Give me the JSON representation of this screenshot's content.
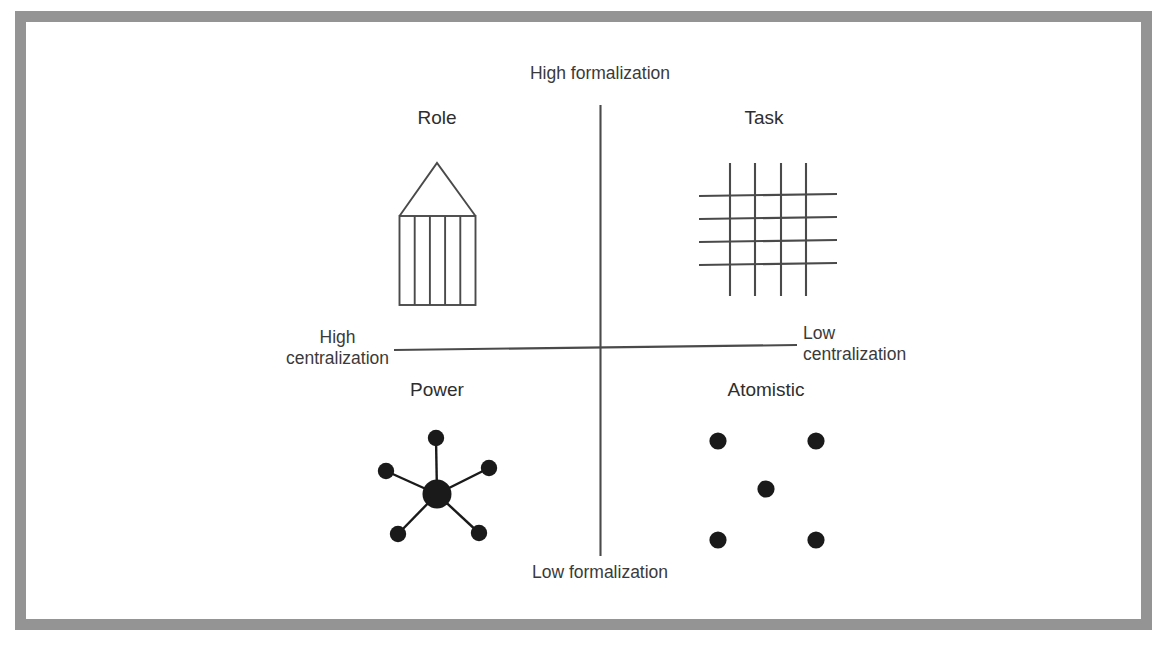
{
  "diagram": {
    "type": "2x2-matrix",
    "axes": {
      "vertical": {
        "top_label": "High formalization",
        "bottom_label": "Low formalization"
      },
      "horizontal": {
        "left_label_line1": "High",
        "left_label_line2": "centralization",
        "right_label_line1": "Low",
        "right_label_line2": "centralization"
      }
    },
    "quadrants": [
      {
        "id": "role",
        "label": "Role",
        "position": "top-left",
        "icon": "greek-temple-icon",
        "icon_description": "Greek temple: triangular pediment over a rectangle divided into 5 columns by 4 vertical lines",
        "columns": 5
      },
      {
        "id": "task",
        "label": "Task",
        "position": "top-right",
        "icon": "lattice-grid-icon",
        "icon_description": "Crossing mesh of 4 vertical and 4 horizontal lines forming a net",
        "vertical_lines": 4,
        "horizontal_lines": 4
      },
      {
        "id": "power",
        "label": "Power",
        "position": "bottom-left",
        "icon": "hub-and-spoke-icon",
        "icon_description": "Large central node with 5 spokes radiating to 5 smaller satellite nodes",
        "satellites": 5
      },
      {
        "id": "atomistic",
        "label": "Atomistic",
        "position": "bottom-right",
        "icon": "scattered-dots-icon",
        "icon_description": "Five unconnected dots arranged as four corners plus one centre",
        "dots": 5
      }
    ],
    "colors": {
      "frame": "#949494",
      "background": "#ffffff",
      "axis_line": "#4a4a4a",
      "icon_line": "#4a4a4a",
      "node_fill": "#1a1a1a",
      "text": "#333333"
    }
  }
}
